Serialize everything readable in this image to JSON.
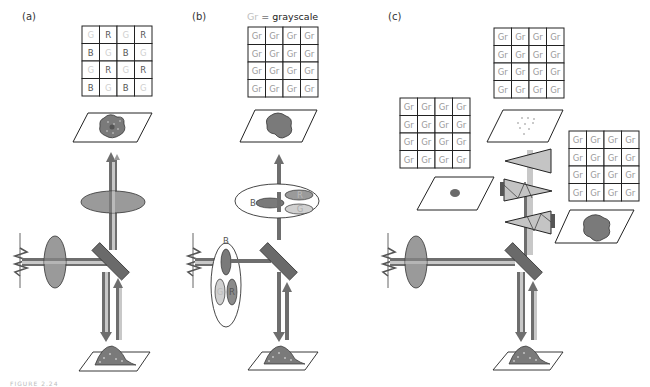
{
  "figure": {
    "caption_fragment": "FIGURE 2.24",
    "colors": {
      "beam_dark": "#6e6e6e",
      "beam_light": "#c8c8c8",
      "lens_fill": "#9a9a9a",
      "mirror_fill": "#6a6a6a",
      "cell_fill": "#7a7a7a",
      "prism_fill": "#c4c4c4",
      "grid_line": "#222222",
      "label_dark": "#555555",
      "label_light": "#c8c8c8"
    },
    "panels": [
      {
        "label": "(a)",
        "description": "Color camera with Bayer color filter array",
        "sensor_grid": [
          [
            "G",
            "R",
            "G",
            "R"
          ],
          [
            "B",
            "G",
            "B",
            "G"
          ],
          [
            "G",
            "R",
            "G",
            "R"
          ],
          [
            "B",
            "G",
            "B",
            "G"
          ]
        ]
      },
      {
        "label": "(b)",
        "legend_abbrev": "Gr",
        "legend_eq": " = ",
        "legend_word": "grayscale",
        "sensor_grid": [
          [
            "Gr",
            "Gr",
            "Gr",
            "Gr"
          ],
          [
            "Gr",
            "Gr",
            "Gr",
            "Gr"
          ],
          [
            "Gr",
            "Gr",
            "Gr",
            "Gr"
          ],
          [
            "Gr",
            "Gr",
            "Gr",
            "Gr"
          ]
        ],
        "emission_filter_wheel": [
          "B",
          "R",
          "G"
        ],
        "excitation_filter_wheel": [
          "B",
          "G",
          "R"
        ]
      },
      {
        "label": "(c)",
        "description": "Three-chip camera with dichroic prism",
        "sensor_grids": [
          [
            [
              "Gr",
              "Gr",
              "Gr",
              "Gr"
            ],
            [
              "Gr",
              "Gr",
              "Gr",
              "Gr"
            ],
            [
              "Gr",
              "Gr",
              "Gr",
              "Gr"
            ],
            [
              "Gr",
              "Gr",
              "Gr",
              "Gr"
            ]
          ],
          [
            [
              "Gr",
              "Gr",
              "Gr",
              "Gr"
            ],
            [
              "Gr",
              "Gr",
              "Gr",
              "Gr"
            ],
            [
              "Gr",
              "Gr",
              "Gr",
              "Gr"
            ],
            [
              "Gr",
              "Gr",
              "Gr",
              "Gr"
            ]
          ],
          [
            [
              "Gr",
              "Gr",
              "Gr",
              "Gr"
            ],
            [
              "Gr",
              "Gr",
              "Gr",
              "Gr"
            ],
            [
              "Gr",
              "Gr",
              "Gr",
              "Gr"
            ],
            [
              "Gr",
              "Gr",
              "Gr",
              "Gr"
            ]
          ]
        ]
      }
    ]
  }
}
